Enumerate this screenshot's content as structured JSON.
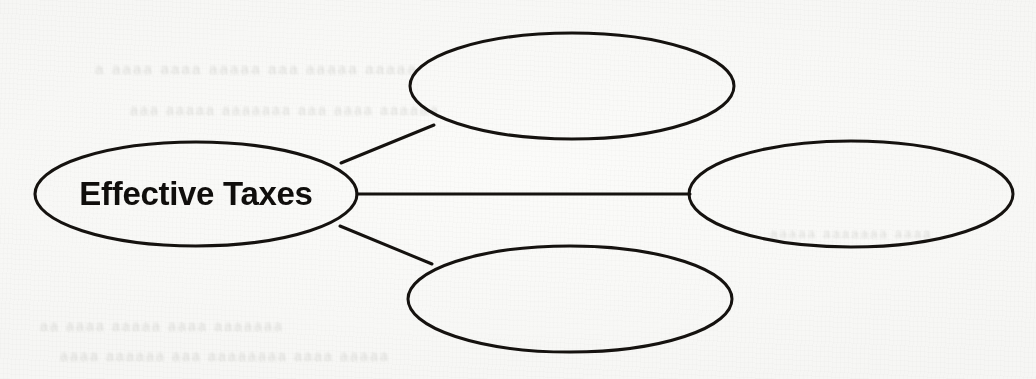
{
  "page": {
    "kind": "concept-map-worksheet",
    "background_color": "#fbfbf9",
    "ink_color": "#15120f",
    "width": 1036,
    "height": 379
  },
  "diagram": {
    "type": "spider-concept-map",
    "center_node": {
      "id": "center",
      "label": "Effective Taxes",
      "filled": true,
      "cx": 196,
      "cy": 194,
      "rx": 161,
      "ry": 52,
      "stroke_width": 3.1,
      "label_font_size": 33
    },
    "branch_nodes": [
      {
        "id": "branch-top",
        "label": "",
        "filled": false,
        "cx": 572,
        "cy": 86,
        "rx": 162,
        "ry": 53,
        "stroke_width": 3.0
      },
      {
        "id": "branch-right",
        "label": "",
        "filled": false,
        "cx": 851,
        "cy": 194,
        "rx": 162,
        "ry": 53,
        "stroke_width": 3.0
      },
      {
        "id": "branch-bottom",
        "label": "",
        "filled": false,
        "cx": 570,
        "cy": 299,
        "rx": 162,
        "ry": 53,
        "stroke_width": 3.0
      }
    ],
    "connectors": [
      {
        "id": "connector-center-to-top",
        "from": "center",
        "to": "branch-top",
        "x1": 341,
        "y1": 163,
        "x2": 434,
        "y2": 125,
        "stroke_width": 3.0
      },
      {
        "id": "connector-center-to-right",
        "from": "center",
        "to": "branch-right",
        "x1": 357,
        "y1": 194,
        "x2": 690,
        "y2": 194,
        "stroke_width": 3.0
      },
      {
        "id": "connector-center-to-bottom",
        "from": "center",
        "to": "branch-bottom",
        "x1": 340,
        "y1": 226,
        "x2": 432,
        "y2": 264,
        "stroke_width": 3.0
      }
    ]
  },
  "bleed_through": {
    "note": "illegible ghost text from reverse side of page",
    "lines": [
      {
        "id": "bleed-1",
        "text": "a aaaa aaaa  aaaaa aaa  aaaaa  aaaaa",
        "x": 95,
        "y": 60,
        "size": 15
      },
      {
        "id": "bleed-2",
        "text": "aaa aaaaa  aaaaaaa  aaa aaaa aaaaaa",
        "x": 130,
        "y": 102,
        "size": 14
      },
      {
        "id": "bleed-3",
        "text": "aa aaaa  aaaaa aaaa  aaaaaaa",
        "x": 40,
        "y": 318,
        "size": 14
      },
      {
        "id": "bleed-4",
        "text": "aaaa aaaaaa  aaa aaaaaaaa aaaa aaaaa",
        "x": 60,
        "y": 348,
        "size": 14
      },
      {
        "id": "bleed-5",
        "text": "aaaaa  aaaaaaa  aaaa",
        "x": 770,
        "y": 226,
        "size": 13
      }
    ]
  }
}
